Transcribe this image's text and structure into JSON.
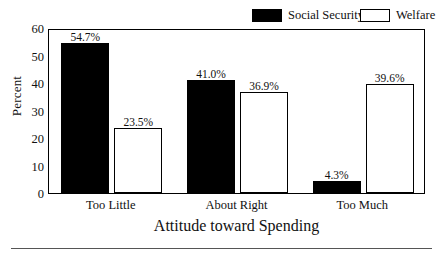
{
  "chart_data": {
    "type": "bar",
    "title": "",
    "xlabel": "Attitude toward Spending",
    "ylabel": "Percent",
    "categories": [
      "Too Little",
      "About Right",
      "Too Much"
    ],
    "series": [
      {
        "name": "Social Security",
        "values": [
          54.7,
          41.0,
          4.3
        ],
        "value_labels": [
          "54.7%",
          "41.0%",
          "4.3%"
        ],
        "fill": "#000000",
        "stroke": "#000000"
      },
      {
        "name": "Welfare",
        "values": [
          23.5,
          36.9,
          39.6
        ],
        "value_labels": [
          "23.5%",
          "36.9%",
          "39.6%"
        ],
        "fill": "#ffffff",
        "stroke": "#000000"
      }
    ],
    "ylim": [
      0,
      60
    ],
    "yticks": [
      0,
      10,
      20,
      30,
      40,
      50,
      60
    ],
    "ytick_labels": [
      "0",
      "10",
      "20",
      "30",
      "40",
      "50",
      "60"
    ],
    "grid": false,
    "legend_position": "top-right"
  },
  "legend": {
    "entries": [
      {
        "label": "Social Security",
        "swatch": "filled-black-square"
      },
      {
        "label": "Welfare",
        "swatch": "open-white-square"
      }
    ]
  }
}
